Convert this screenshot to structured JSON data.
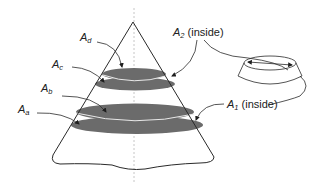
{
  "diagram": {
    "type": "cone-cross-sections",
    "labels": {
      "a": {
        "base": "A",
        "sub": "a",
        "suffix": ""
      },
      "b": {
        "base": "A",
        "sub": "b",
        "suffix": ""
      },
      "c": {
        "base": "A",
        "sub": "c",
        "suffix": ""
      },
      "d": {
        "base": "A",
        "sub": "d",
        "suffix": ""
      },
      "two": {
        "base": "A",
        "sub": "2",
        "suffix": " (inside)"
      },
      "one": {
        "base": "A",
        "sub": "1",
        "suffix": " (inside)"
      }
    },
    "colors": {
      "line": "#2a2a2a",
      "disk_fill": "#6b6b6b",
      "axis": "#b0b0b0",
      "background": "#ffffff"
    }
  }
}
